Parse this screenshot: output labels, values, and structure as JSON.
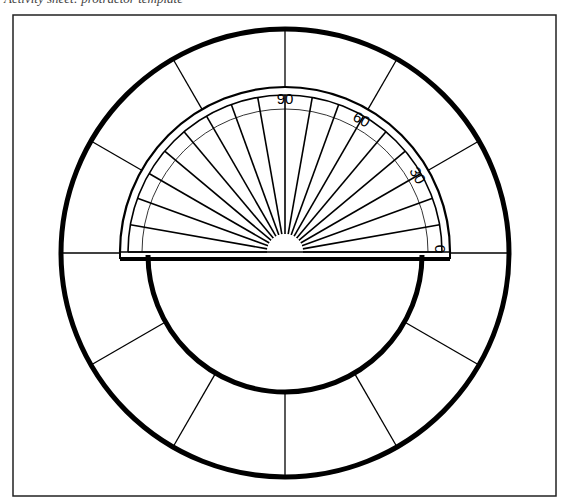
{
  "caption": {
    "text": "Activity sheet: protractor template"
  },
  "diagram": {
    "frame": {
      "x": 13,
      "y": 15,
      "w": 543,
      "h": 481,
      "stroke": "#222222"
    },
    "outer_circle": {
      "cx": 285,
      "cy": 253,
      "r": 224,
      "stroke_width": 5
    },
    "inner_semicircle": {
      "cx": 285,
      "cy": 255,
      "r": 137,
      "stroke_width": 5
    },
    "outer_ring_spoke_interval_deg": 30,
    "protractor": {
      "cx": 285,
      "cy": 252,
      "outer_radius": 165,
      "band_radius": 157,
      "scale_radius": 143,
      "hub_radius": 18,
      "spoke_interval_deg": 10,
      "labels": [
        {
          "text": "90",
          "angle": 90
        },
        {
          "text": "60",
          "angle": 60
        },
        {
          "text": "30",
          "angle": 30
        },
        {
          "text": "0",
          "angle": 0
        }
      ]
    },
    "baseline": {
      "y": 258,
      "x1": 147,
      "x2": 423
    },
    "colors": {
      "ink": "#000000",
      "paper": "#ffffff"
    }
  }
}
